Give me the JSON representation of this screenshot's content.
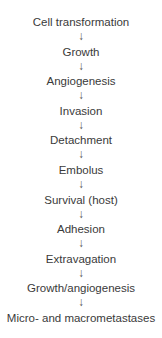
{
  "diagram": {
    "type": "vertical-flowchart",
    "arrow_glyph": "↓",
    "steps": [
      "Cell transformation",
      "Growth",
      "Angiogenesis",
      "Invasion",
      "Detachment",
      "Embolus",
      "Survival (host)",
      "Adhesion",
      "Extravagation",
      "Growth/angiogenesis",
      "Micro- and macrometastases"
    ]
  }
}
